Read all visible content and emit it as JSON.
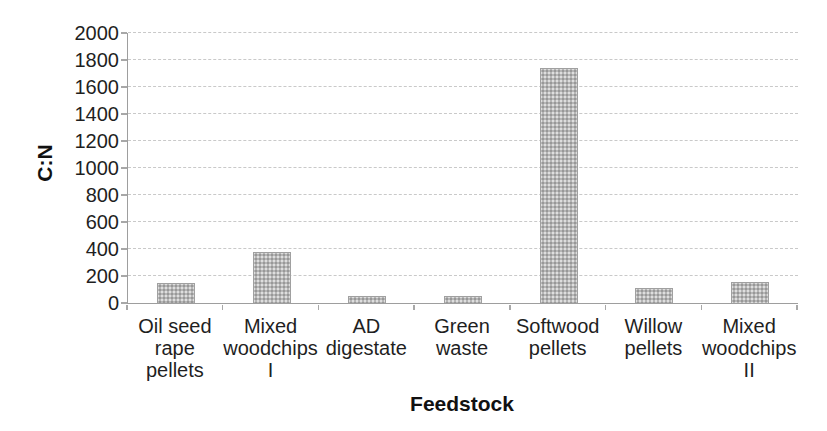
{
  "chart_data": {
    "type": "bar",
    "xlabel": "Feedstock",
    "ylabel": "C:N",
    "categories": [
      "Oil seed rape pellets",
      "Mixed woodchips I",
      "AD digestate",
      "Green waste",
      "Softwood pellets",
      "Willow pellets",
      "Mixed woodchips II"
    ],
    "category_lines": [
      [
        "Oil seed",
        "rape",
        "pellets"
      ],
      [
        "Mixed",
        "woodchips",
        "I"
      ],
      [
        "AD",
        "digestate"
      ],
      [
        "Green",
        "waste"
      ],
      [
        "Softwood",
        "pellets"
      ],
      [
        "Willow",
        "pellets"
      ],
      [
        "Mixed",
        "woodchips",
        "II"
      ]
    ],
    "values": [
      150,
      380,
      50,
      55,
      1740,
      110,
      155
    ],
    "ylim": [
      0,
      2000
    ],
    "y_ticks": [
      0,
      200,
      400,
      600,
      800,
      1000,
      1200,
      1400,
      1600,
      1800,
      2000
    ],
    "grid": true,
    "legend": false,
    "bar_color": "#b6b6b6",
    "gridline_color": "#c9c9c9",
    "axis_color": "#9e9e9e",
    "text_color": "#1f1f1f",
    "background_color": "#ffffff"
  }
}
